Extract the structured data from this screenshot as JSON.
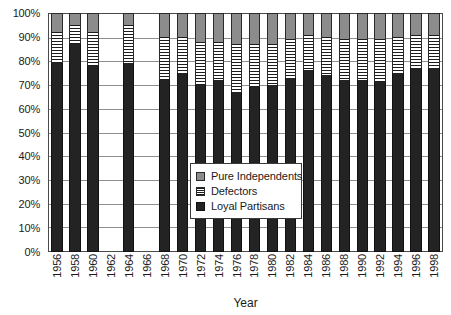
{
  "chart_data": {
    "type": "bar",
    "subtype": "stacked-100-percent",
    "title": "",
    "xlabel": "Year",
    "ylabel": "",
    "ylim": [
      0,
      100
    ],
    "y_tick_labels": [
      "100%",
      "90%",
      "80%",
      "70%",
      "60%",
      "50%",
      "40%",
      "30%",
      "20%",
      "10%",
      "0%"
    ],
    "y_tick_values": [
      100,
      90,
      80,
      70,
      60,
      50,
      40,
      30,
      20,
      10,
      0
    ],
    "grid": true,
    "grid_axis": "y",
    "legend_position": "center",
    "categories": [
      "1956",
      "1958",
      "1960",
      "1962",
      "1964",
      "1966",
      "1968",
      "1970",
      "1972",
      "1974",
      "1976",
      "1978",
      "1980",
      "1982",
      "1984",
      "1986",
      "1988",
      "1990",
      "1992",
      "1994",
      "1996",
      "1998"
    ],
    "series": [
      {
        "name": "Loyal Partisans",
        "color": "#232323",
        "pattern": "solid",
        "values": [
          79,
          87,
          78,
          null,
          79,
          null,
          72,
          75,
          70,
          72,
          67,
          69,
          70,
          73,
          76,
          74,
          72,
          72,
          71,
          75,
          77,
          77
        ]
      },
      {
        "name": "Defectors",
        "color": "#ffffff",
        "pattern": "horizontal-stripes",
        "values": [
          13,
          8,
          14,
          null,
          16,
          null,
          18,
          15,
          18,
          16,
          20,
          18,
          17,
          16,
          15,
          16,
          17,
          17,
          18,
          15,
          14,
          14
        ]
      },
      {
        "name": "Pure Independents",
        "color": "#8c8c8c",
        "pattern": "solid",
        "values": [
          8,
          5,
          8,
          null,
          5,
          null,
          10,
          10,
          12,
          12,
          13,
          13,
          13,
          11,
          9,
          10,
          11,
          11,
          11,
          10,
          9,
          9
        ]
      }
    ],
    "missing_categories": [
      "1962",
      "1966"
    ],
    "legend_entries": [
      "Pure Independents",
      "Defectors",
      "Loyal Partisans"
    ]
  },
  "legend": {
    "items": [
      {
        "label": "Pure Independents",
        "swatch": "gray-square-icon"
      },
      {
        "label": "Defectors",
        "swatch": "striped-square-icon"
      },
      {
        "label": "Loyal Partisans",
        "swatch": "black-square-icon"
      }
    ]
  },
  "axes": {
    "x_title": "Year"
  },
  "colors": {
    "loyal_partisans": "#232323",
    "pure_independents": "#8c8c8c",
    "defectors": "#ffffff",
    "gridline": "#8f8f8f",
    "frame": "#4a4a4a",
    "text": "#1a1a1a",
    "background": "#ffffff"
  }
}
